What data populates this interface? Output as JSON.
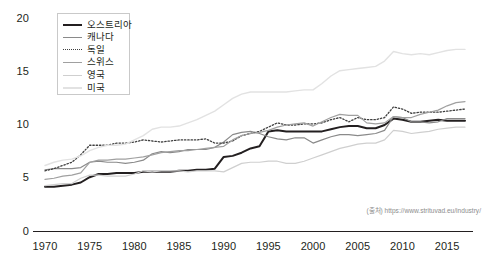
{
  "chart_data": {
    "type": "line",
    "title": "",
    "xlabel": "",
    "ylabel": "",
    "xlim": [
      1970,
      2017
    ],
    "ylim": [
      0,
      20
    ],
    "grid": false,
    "legend_position": "top-left",
    "xticks": [
      "1970",
      "1975",
      "1980",
      "1985",
      "1990",
      "1995",
      "2000",
      "2005",
      "2010",
      "2015"
    ],
    "yticks": [
      "0",
      "5",
      "10",
      "15",
      "20"
    ],
    "x": [
      1970,
      1971,
      1972,
      1973,
      1974,
      1975,
      1976,
      1977,
      1978,
      1979,
      1980,
      1981,
      1982,
      1983,
      1984,
      1985,
      1986,
      1987,
      1988,
      1989,
      1990,
      1991,
      1992,
      1993,
      1994,
      1995,
      1996,
      1997,
      1998,
      1999,
      2000,
      2001,
      2002,
      2003,
      2004,
      2005,
      2006,
      2007,
      2008,
      2009,
      2010,
      2011,
      2012,
      2013,
      2014,
      2015,
      2016,
      2017
    ],
    "series": [
      {
        "name": "오스트리아",
        "style": "solid",
        "color": "#231f20",
        "width": 2.0,
        "values": [
          4.2,
          4.2,
          4.3,
          4.4,
          4.6,
          5.1,
          5.4,
          5.4,
          5.5,
          5.5,
          5.5,
          5.6,
          5.6,
          5.6,
          5.6,
          5.7,
          5.7,
          5.8,
          5.8,
          5.9,
          7.0,
          7.1,
          7.4,
          7.8,
          8.0,
          9.4,
          9.5,
          9.4,
          9.4,
          9.4,
          9.4,
          9.4,
          9.6,
          9.8,
          9.9,
          9.9,
          9.7,
          9.7,
          10.0,
          10.6,
          10.5,
          10.3,
          10.3,
          10.4,
          10.5,
          10.4,
          10.4,
          10.4
        ]
      },
      {
        "name": "캐나다",
        "style": "solid",
        "color": "#8a8a8a",
        "width": 1.2,
        "values": [
          5.8,
          5.9,
          5.9,
          5.9,
          6.0,
          6.5,
          6.6,
          6.5,
          6.5,
          6.4,
          6.5,
          6.7,
          7.3,
          7.5,
          7.4,
          7.5,
          7.7,
          7.7,
          7.7,
          7.9,
          8.4,
          9.1,
          9.3,
          9.4,
          9.2,
          8.9,
          8.7,
          8.6,
          8.8,
          8.8,
          8.3,
          8.6,
          8.9,
          9.1,
          9.1,
          9.0,
          9.1,
          9.2,
          9.5,
          10.8,
          10.7,
          10.3,
          10.3,
          10.2,
          10.3,
          10.6,
          10.6,
          10.6
        ]
      },
      {
        "name": "독일",
        "style": "dotted",
        "color": "#3f3f3f",
        "width": 1.3,
        "values": [
          5.7,
          5.9,
          6.2,
          6.5,
          7.2,
          8.1,
          8.1,
          8.1,
          8.3,
          8.3,
          8.4,
          8.6,
          8.5,
          8.4,
          8.5,
          8.6,
          8.6,
          8.6,
          8.7,
          8.3,
          8.3,
          8.5,
          9.0,
          9.2,
          9.4,
          9.8,
          10.2,
          10.0,
          10.0,
          10.1,
          10.1,
          10.2,
          10.5,
          10.7,
          10.3,
          10.7,
          10.5,
          10.5,
          10.7,
          11.7,
          11.5,
          11.1,
          11.2,
          11.2,
          11.2,
          11.3,
          11.4,
          11.5
        ]
      },
      {
        "name": "스위스",
        "style": "solid",
        "color": "#a0a0a0",
        "width": 1.2,
        "values": [
          4.9,
          5.0,
          5.2,
          5.3,
          5.5,
          6.5,
          6.7,
          6.7,
          6.8,
          6.8,
          6.9,
          7.0,
          7.2,
          7.4,
          7.5,
          7.6,
          7.6,
          7.7,
          7.8,
          7.9,
          8.0,
          8.6,
          9.0,
          9.2,
          9.3,
          9.5,
          9.8,
          10.0,
          10.1,
          10.2,
          9.9,
          10.3,
          10.7,
          11.0,
          10.9,
          10.9,
          10.2,
          10.1,
          10.2,
          10.8,
          10.7,
          10.7,
          11.0,
          11.2,
          11.4,
          11.8,
          12.1,
          12.2
        ]
      },
      {
        "name": "영국",
        "style": "solid",
        "color": "#cfcfcf",
        "width": 1.2,
        "values": [
          4.3,
          4.4,
          4.5,
          4.5,
          5.0,
          5.3,
          5.3,
          5.2,
          5.2,
          5.2,
          5.4,
          5.7,
          5.6,
          5.7,
          5.7,
          5.7,
          5.6,
          5.7,
          5.7,
          5.7,
          5.6,
          6.0,
          6.4,
          6.5,
          6.5,
          6.6,
          6.6,
          6.4,
          6.4,
          6.6,
          6.9,
          7.2,
          7.5,
          7.8,
          8.0,
          8.2,
          8.3,
          8.3,
          8.6,
          9.5,
          9.4,
          9.2,
          9.3,
          9.4,
          9.6,
          9.7,
          9.8,
          9.8
        ]
      },
      {
        "name": "미국",
        "style": "solid",
        "color": "#e2e2e2",
        "width": 1.4,
        "values": [
          6.2,
          6.5,
          6.7,
          6.8,
          7.1,
          7.6,
          7.9,
          8.1,
          8.1,
          8.2,
          8.6,
          9.0,
          9.6,
          9.8,
          9.8,
          9.9,
          10.2,
          10.5,
          10.9,
          11.3,
          11.9,
          12.5,
          12.9,
          13.1,
          13.1,
          13.1,
          13.1,
          13.1,
          13.2,
          13.3,
          13.3,
          13.9,
          14.6,
          15.1,
          15.2,
          15.3,
          15.4,
          15.5,
          16.0,
          16.9,
          16.7,
          16.6,
          16.7,
          16.6,
          16.8,
          17.0,
          17.1,
          17.1
        ]
      }
    ],
    "source_note": "(출처) https://www.strituvad.eu/industry/"
  }
}
